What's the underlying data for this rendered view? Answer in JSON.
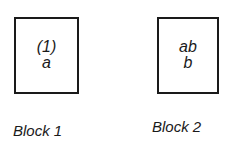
{
  "blocks": [
    {
      "label": "Block 1",
      "lines": [
        "(1)",
        "a"
      ]
    },
    {
      "label": "Block 2",
      "lines": [
        "ab",
        "b"
      ]
    }
  ]
}
